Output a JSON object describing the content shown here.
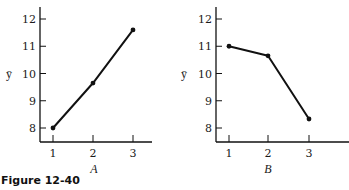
{
  "caption": "Figure 12-40",
  "chart_data": [
    {
      "type": "line",
      "panel": "A",
      "title": "",
      "xlabel": "A",
      "ylabel": "ȳ",
      "x": [
        1,
        2,
        3
      ],
      "values": [
        8.0,
        9.65,
        11.6
      ],
      "xticks": [
        "1",
        "2",
        "3"
      ],
      "yticks": [
        "8",
        "9",
        "10",
        "11",
        "12"
      ],
      "ylim": [
        7.5,
        12.5
      ],
      "xlim": [
        0.7,
        3.5
      ],
      "grid": false,
      "legend": null,
      "markers": true
    },
    {
      "type": "line",
      "panel": "B",
      "title": "",
      "xlabel": "B",
      "ylabel": "ȳ",
      "x": [
        1,
        2,
        3
      ],
      "values": [
        11.0,
        10.65,
        8.33
      ],
      "xticks": [
        "1",
        "2",
        "3"
      ],
      "yticks": [
        "8",
        "9",
        "10",
        "11",
        "12"
      ],
      "ylim": [
        7.5,
        12.5
      ],
      "xlim": [
        0.7,
        3.5
      ],
      "grid": false,
      "legend": null,
      "markers": true
    }
  ],
  "style": {
    "line_color": "#111111",
    "axis_color": "#111111"
  }
}
